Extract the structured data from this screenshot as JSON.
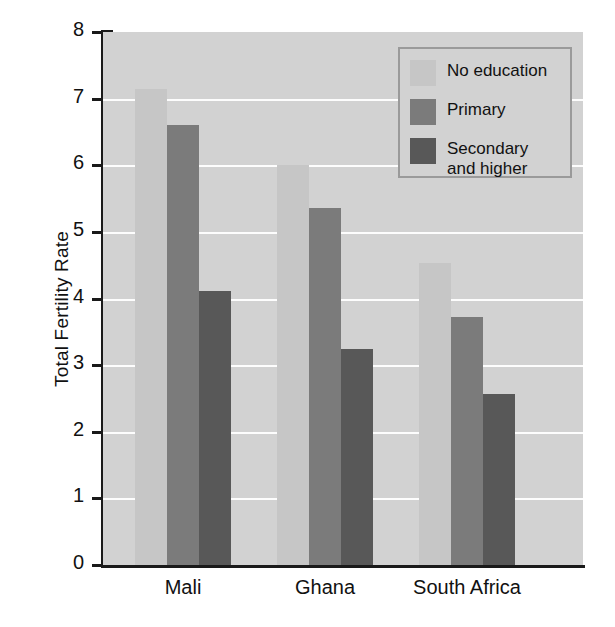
{
  "chart_data": {
    "type": "bar",
    "title": "",
    "xlabel": "",
    "ylabel": "Total Fertility Rate",
    "categories": [
      "Mali",
      "Ghana",
      "South Africa"
    ],
    "series": [
      {
        "name": "No education",
        "color": "#c6c6c6",
        "values": [
          7.15,
          6.0,
          4.53
        ]
      },
      {
        "name": "Primary",
        "color": "#7b7b7b",
        "values": [
          6.6,
          5.36,
          3.72
        ]
      },
      {
        "name": "Secondary and higher",
        "color": "#585858",
        "values": [
          4.12,
          3.24,
          2.57
        ]
      }
    ],
    "ylim": [
      0,
      8
    ],
    "yticks": [
      0,
      1,
      2,
      3,
      4,
      5,
      6,
      7,
      8
    ],
    "ytick_labels": [
      "0",
      "1",
      "2",
      "3",
      "4",
      "5",
      "6",
      "7",
      "8"
    ],
    "grid": true,
    "gridlines_at": [
      1,
      2,
      3,
      4,
      5,
      6,
      7
    ],
    "legend_position": "top-right",
    "legend_entries": [
      "No education",
      "Primary",
      "Secondary\nand higher"
    ],
    "plot_background": "#d2d2d2",
    "gridline_color": "#fdfdfd",
    "axis_color": "#1a1a1a"
  }
}
